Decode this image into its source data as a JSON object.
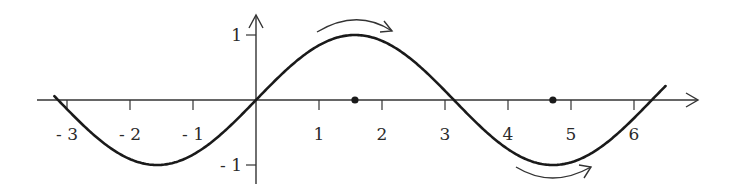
{
  "diagram": {
    "title": "",
    "function": "sin(x)",
    "colors": {
      "curve": "#1a1a1a",
      "axis": "#333333",
      "text": "#2a2a2a",
      "background": "#ffffff"
    },
    "x_axis": {
      "range": [
        -3.45,
        7.0
      ],
      "ticks": [
        -3,
        -2,
        -1,
        1,
        2,
        3,
        4,
        5,
        6
      ],
      "tick_labels": [
        "- 3",
        "- 2",
        "- 1",
        "1",
        "2",
        "3",
        "4",
        "5",
        "6"
      ]
    },
    "y_axis": {
      "ticks": [
        1,
        -1
      ],
      "tick_labels": [
        "1",
        "- 1"
      ]
    },
    "curve_domain": [
      -3.2,
      6.5
    ],
    "marked_points": [
      {
        "x": 1.5708,
        "y": 0,
        "label": "π/2"
      },
      {
        "x": 4.7124,
        "y": 0,
        "label": "3π/2"
      }
    ],
    "annotations": [
      {
        "type": "curved-arrow",
        "position": "above maximum",
        "direction": "right"
      },
      {
        "type": "curved-arrow",
        "position": "below minimum",
        "direction": "right"
      }
    ]
  }
}
